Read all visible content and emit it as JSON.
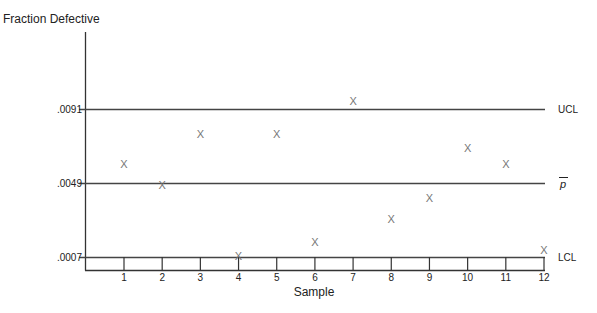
{
  "chart_data": {
    "type": "scatter",
    "title": "",
    "ylabel": "Fraction Defective",
    "xlabel": "Sample",
    "categories": [
      "1",
      "2",
      "3",
      "4",
      "5",
      "6",
      "7",
      "8",
      "9",
      "10",
      "11",
      "12"
    ],
    "x": [
      1,
      2,
      3,
      4,
      5,
      6,
      7,
      8,
      9,
      10,
      11,
      12
    ],
    "values": [
      0.006,
      0.0048,
      0.0077,
      0.0008,
      0.0077,
      0.0016,
      0.0096,
      0.0029,
      0.0041,
      0.0069,
      0.006,
      0.0011
    ],
    "marker": "X",
    "control_lines": [
      {
        "name": "UCL",
        "value": 0.0091,
        "label": ".0091"
      },
      {
        "name": "p̄",
        "value": 0.0049,
        "label": ".0049"
      },
      {
        "name": "LCL",
        "value": 0.0007,
        "label": ".0007"
      }
    ],
    "ylim": [
      0.0,
      0.0125
    ],
    "grid": false,
    "legend": "none"
  },
  "labels": {
    "y_title": "Fraction Defective",
    "x_title": "Sample",
    "ucl": "UCL",
    "pbar": "p",
    "lcl": "LCL",
    "ucl_val": ".0091",
    "pbar_val": ".0049",
    "lcl_val": ".0007"
  },
  "colors": {
    "axis": "#333333",
    "line": "#444444",
    "marker": "#777777"
  }
}
